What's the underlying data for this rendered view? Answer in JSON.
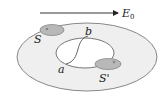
{
  "diagram": {
    "field_label": "E",
    "field_subscript": "0",
    "surface_label_1": "S",
    "surface_label_2": "S'",
    "point_a": "a",
    "point_b": "b",
    "colors": {
      "outer_fill": "#efefef",
      "outline": "#777777",
      "patch_fill": "#b8b8b8",
      "hole_fill": "#ffffff"
    }
  }
}
